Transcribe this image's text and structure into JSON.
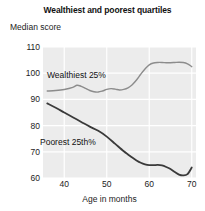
{
  "chart_data": {
    "type": "line",
    "title": "Wealthiest and poorest quartiles",
    "xlabel": "Age in months",
    "ylabel": "Median score",
    "xlim": [
      35,
      71
    ],
    "ylim": [
      60,
      110
    ],
    "grid": true,
    "legend_position": "inline-annotation",
    "xticks": [
      40,
      50,
      60,
      70
    ],
    "yticks": [
      60,
      70,
      80,
      90,
      100,
      110
    ],
    "series": [
      {
        "name": "Wealthiest 25%",
        "color": "#8c8c8c",
        "x": [
          36,
          38,
          40,
          42,
          43,
          44,
          45,
          46,
          47,
          48,
          49,
          50,
          51,
          52,
          53,
          54,
          55,
          56,
          57,
          58,
          59,
          60,
          61,
          62,
          63,
          64,
          65,
          66,
          67,
          68,
          69,
          70
        ],
        "values": [
          93.2,
          93.4,
          93.8,
          94.6,
          95.4,
          95.0,
          94.2,
          93.4,
          92.9,
          92.8,
          93.2,
          93.8,
          94.1,
          93.9,
          93.6,
          93.8,
          94.4,
          95.6,
          97.4,
          99.6,
          101.6,
          103.2,
          103.9,
          104.1,
          104.1,
          104.0,
          104.0,
          104.1,
          104.2,
          104.1,
          103.6,
          102.5
        ]
      },
      {
        "name": "Poorest 25th%",
        "color": "#3a3a3a",
        "x": [
          36,
          38,
          40,
          42,
          44,
          46,
          48,
          50,
          52,
          54,
          55,
          56,
          57,
          58,
          59,
          60,
          61,
          62,
          63,
          64,
          65,
          66,
          67,
          68,
          69,
          70
        ],
        "values": [
          88.5,
          86.8,
          85.0,
          83.2,
          81.4,
          79.6,
          78.0,
          75.8,
          73.0,
          70.2,
          69.0,
          67.8,
          66.7,
          65.8,
          65.2,
          64.9,
          64.9,
          65.0,
          64.8,
          64.2,
          63.4,
          62.3,
          61.3,
          61.0,
          61.5,
          64.0
        ]
      }
    ],
    "annotations": [
      {
        "text": "Wealthiest 25%",
        "x": 41,
        "y": 99
      },
      {
        "text": "Poorest 25th%",
        "x": 39,
        "y": 73
      }
    ]
  }
}
